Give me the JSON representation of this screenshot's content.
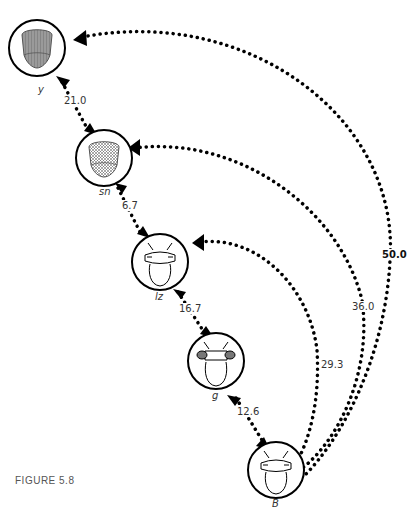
{
  "figure": {
    "caption": "FIGURE 5.8"
  },
  "nodes": [
    {
      "id": "y",
      "label": "y",
      "style": "gray-head"
    },
    {
      "id": "sn",
      "label": "sn",
      "style": "hatched-head"
    },
    {
      "id": "lz",
      "label": "lz",
      "style": "fly-head"
    },
    {
      "id": "g",
      "label": "g",
      "style": "fly-head-dark-eyes"
    },
    {
      "id": "B",
      "label": "B",
      "style": "fly-head"
    }
  ],
  "distances": [
    {
      "from": "y",
      "to": "sn",
      "value": "21.0"
    },
    {
      "from": "sn",
      "to": "lz",
      "value": "6.7"
    },
    {
      "from": "lz",
      "to": "g",
      "value": "16.7"
    },
    {
      "from": "g",
      "to": "B",
      "value": "12.6"
    },
    {
      "from": "lz",
      "to": "B",
      "value": "29.3"
    },
    {
      "from": "sn",
      "to": "B",
      "value": "36.0"
    },
    {
      "from": "y",
      "to": "B",
      "value": "50.0",
      "bold": true
    }
  ]
}
